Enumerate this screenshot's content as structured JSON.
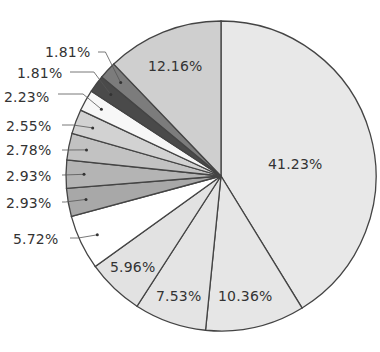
{
  "chart_data": {
    "type": "pie",
    "title": "",
    "start_angle": "12 o'clock",
    "direction": "clockwise",
    "slices": [
      {
        "label": "41.23%",
        "value": 41.23,
        "color": "#e8e8e8"
      },
      {
        "label": "10.36%",
        "value": 10.36,
        "color": "#e6e6e6"
      },
      {
        "label": "7.53%",
        "value": 7.53,
        "color": "#e4e4e4"
      },
      {
        "label": "5.96%",
        "value": 5.96,
        "color": "#e2e2e2"
      },
      {
        "label": "5.72%",
        "value": 5.72,
        "color": "#ffffff"
      },
      {
        "label": "2.93%",
        "value": 2.93,
        "color": "#a8a8a8"
      },
      {
        "label": "2.93%",
        "value": 2.93,
        "color": "#b4b4b4"
      },
      {
        "label": "2.78%",
        "value": 2.78,
        "color": "#c2c2c2"
      },
      {
        "label": "2.55%",
        "value": 2.55,
        "color": "#d2d2d2"
      },
      {
        "label": "2.23%",
        "value": 2.23,
        "color": "#f7f7f7"
      },
      {
        "label": "1.81%",
        "value": 1.81,
        "color": "#4a4a4a"
      },
      {
        "label": "1.81%",
        "value": 1.81,
        "color": "#7c7c7c"
      },
      {
        "label": "12.16%",
        "value": 12.16,
        "color": "#cfcfcf"
      }
    ],
    "legend": "none",
    "edge_color": "#444444"
  },
  "labels": {
    "inside": [
      "41.23%",
      "10.36%",
      "7.53%",
      "5.96%",
      "12.16%"
    ],
    "outside": [
      "5.72%",
      "2.93%",
      "2.93%",
      "2.78%",
      "2.55%",
      "2.23%",
      "1.81%",
      "1.81%"
    ]
  }
}
